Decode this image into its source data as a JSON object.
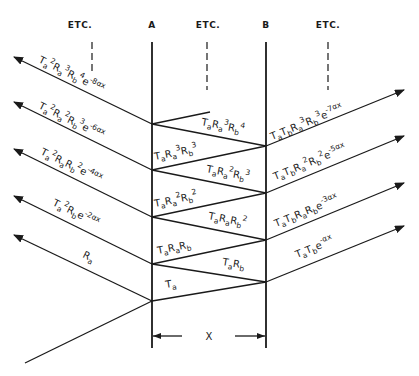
{
  "headers": {
    "etc_left": "ETC.",
    "interface_a": "A",
    "etc_middle": "ETC.",
    "interface_b": "B",
    "etc_right": "ETC."
  },
  "dimension": {
    "label": "X"
  },
  "incident": {
    "label": ""
  },
  "reflected_rays": [
    {
      "T": "T",
      "T_sub": "a",
      "exp": "2",
      "R1": "R",
      "R1_sub": "a",
      "R1_exp": "3",
      "R2": "R",
      "R2_sub": "b",
      "R2_exp": "4",
      "e": "e",
      "e_exp": "-8αx",
      "text": "Ta²Ra³Rb⁴e⁻⁸ᵅˣ"
    },
    {
      "T": "T",
      "T_sub": "a",
      "exp": "2",
      "R1": "R",
      "R1_sub": "a",
      "R1_exp": "2",
      "R2": "R",
      "R2_sub": "b",
      "R2_exp": "3",
      "e": "e",
      "e_exp": "-6αx",
      "text": "Ta²Ra²Rb³e⁻⁶ᵅˣ"
    },
    {
      "T": "T",
      "T_sub": "a",
      "exp": "2",
      "R1": "R",
      "R1_sub": "a",
      "R1_exp": "",
      "R2": "R",
      "R2_sub": "b",
      "R2_exp": "2",
      "e": "e",
      "e_exp": "-4αx",
      "text": "Ta²RaRb²e⁻⁴ᵅˣ"
    },
    {
      "T": "T",
      "T_sub": "a",
      "exp": "2",
      "R1": "",
      "R1_sub": "",
      "R1_exp": "",
      "R2": "R",
      "R2_sub": "b",
      "R2_exp": "",
      "e": "e",
      "e_exp": "-2αx",
      "text": "Ta²Rbe⁻²ᵅˣ"
    },
    {
      "text": "Ra",
      "R": "R",
      "R_sub": "a"
    }
  ],
  "transmitted_rays": [
    {
      "text": "TaTbRa³Rb³e⁻⁷ᵅˣ",
      "prefix": "T",
      "p_sub": "a",
      "T2": "T",
      "T2_sub": "b",
      "R1": "R",
      "R1_sub": "a",
      "R1_exp": "3",
      "R2": "R",
      "R2_sub": "b",
      "R2_exp": "3",
      "e": "e",
      "e_exp": "-7αx"
    },
    {
      "text": "TaTbRa²Rb²e⁻⁵ᵅˣ",
      "prefix": "T",
      "p_sub": "a",
      "T2": "T",
      "T2_sub": "b",
      "R1": "R",
      "R1_sub": "a",
      "R1_exp": "2",
      "R2": "R",
      "R2_sub": "b",
      "R2_exp": "2",
      "e": "e",
      "e_exp": "-5αx"
    },
    {
      "text": "TaTbRaRbe⁻³ᵅˣ",
      "prefix": "T",
      "p_sub": "a",
      "T2": "T",
      "T2_sub": "b",
      "R1": "R",
      "R1_sub": "a",
      "R1_exp": "",
      "R2": "R",
      "R2_sub": "b",
      "R2_exp": "",
      "e": "e",
      "e_exp": "-3αx"
    },
    {
      "text": "TaTbe⁻ᵅˣ",
      "prefix": "T",
      "p_sub": "a",
      "T2": "T",
      "T2_sub": "b",
      "e": "e",
      "e_exp": "-αx"
    }
  ],
  "internal_rays": [
    {
      "text": "TaRa³Rb⁴",
      "T": "T",
      "T_sub": "a",
      "R1": "R",
      "R1_sub": "a",
      "R1_exp": "3",
      "R2": "R",
      "R2_sub": "b",
      "R2_exp": "4"
    },
    {
      "text": "TaRa³Rb³",
      "T": "T",
      "T_sub": "a",
      "R1": "R",
      "R1_sub": "a",
      "R1_exp": "3",
      "R2": "R",
      "R2_sub": "b",
      "R2_exp": "3"
    },
    {
      "text": "TaRa²Rb³",
      "T": "T",
      "T_sub": "a",
      "R1": "R",
      "R1_sub": "a",
      "R1_exp": "2",
      "R2": "R",
      "R2_sub": "b",
      "R2_exp": "3"
    },
    {
      "text": "TaRa²Rb²",
      "T": "T",
      "T_sub": "a",
      "R1": "R",
      "R1_sub": "a",
      "R1_exp": "2",
      "R2": "R",
      "R2_sub": "b",
      "R2_exp": "2"
    },
    {
      "text": "TaRaRb²",
      "T": "T",
      "T_sub": "a",
      "R1": "R",
      "R1_sub": "a",
      "R2": "R",
      "R2_sub": "b",
      "R2_exp": "2"
    },
    {
      "text": "TaRaRb",
      "T": "T",
      "T_sub": "a",
      "R1": "R",
      "R1_sub": "a",
      "R2": "R",
      "R2_sub": "b"
    },
    {
      "text": "TaRb",
      "T": "T",
      "T_sub": "a",
      "R2": "R",
      "R2_sub": "b"
    },
    {
      "text": "Ta",
      "T": "T",
      "T_sub": "a"
    }
  ],
  "colors": {
    "ink": "#1a1a1a",
    "background": "#ffffff"
  }
}
